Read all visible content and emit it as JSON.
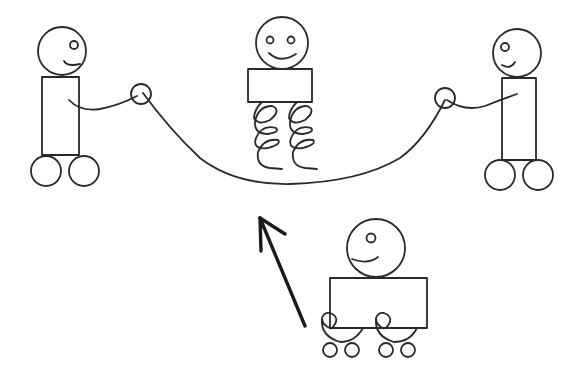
{
  "diagram": {
    "title": "Robots jumping rope",
    "stroke_color": "#2a2a2a",
    "background": "#ffffff",
    "figures": [
      {
        "id": "left-robot",
        "role": "rope turner",
        "head": "circle with one eye and smile",
        "body": "tall rectangle",
        "base": "two wheels"
      },
      {
        "id": "middle-robot",
        "role": "jumper",
        "head": "circle with two eyes and smile",
        "body": "wide rectangle",
        "base": "two coil springs"
      },
      {
        "id": "right-robot",
        "role": "rope turner",
        "head": "circle with one eye and smile",
        "body": "tall rectangle",
        "base": "two wheels"
      },
      {
        "id": "bottom-robot",
        "role": "waiting robot",
        "head": "circle with one eye and smile",
        "body": "wide rectangle",
        "base": "two curled legs with four small wheels"
      }
    ],
    "rope": "curved rope held by left and right robots passing under the middle robot",
    "arrow": "bold arrow pointing up-left from bottom robot toward the rope"
  }
}
